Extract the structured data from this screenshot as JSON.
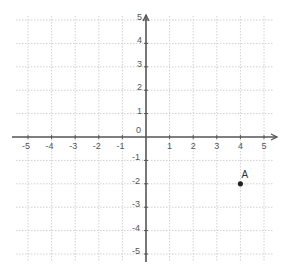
{
  "chart_data": {
    "type": "scatter",
    "title": "",
    "xlabel": "",
    "ylabel": "",
    "xlim": [
      -5,
      5
    ],
    "ylim": [
      -5,
      5
    ],
    "grid": true,
    "x_ticks": [
      "-5",
      "-4",
      "-3",
      "-2",
      "-1",
      "0",
      "1",
      "2",
      "3",
      "4",
      "5"
    ],
    "y_ticks": [
      "5",
      "4",
      "3",
      "2",
      "1",
      "-1",
      "-2",
      "-3",
      "-4",
      "-5"
    ],
    "origin_label": "0",
    "points": [
      {
        "label": "A",
        "x": 4,
        "y": -2
      }
    ]
  },
  "colors": {
    "axis": "#555555",
    "grid": "#d0d0d0",
    "point": "#222222",
    "text": "#555555"
  }
}
